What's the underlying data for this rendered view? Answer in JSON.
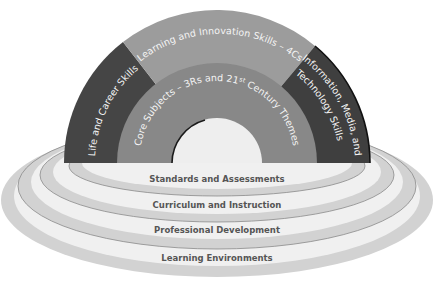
{
  "diagram": {
    "type": "rainbow-arch-framework",
    "arch": {
      "outer_band": [
        {
          "id": "life-career",
          "label": "Life and Career Skills",
          "color": "#454545"
        },
        {
          "id": "learning-innovation",
          "label": "Learning and Innovation Skills – 4Cs",
          "color": "#9c9c9c"
        },
        {
          "id": "info-media-tech",
          "label": "Information, Media, and Technology Skills",
          "label_line1": "Information, Media, and",
          "label_line2": "Technology Skills",
          "color": "#3f3f3f"
        }
      ],
      "inner_band": {
        "id": "core-subjects",
        "label": "Core Subjects – 3Rs and 21st Century Themes",
        "label_pre": "Core Subjects – 3Rs and 21",
        "label_sup": "st",
        "label_post": " Century Themes",
        "color": "#888888"
      },
      "center_color": "#eeeeee"
    },
    "support_systems": [
      {
        "label": "Standards and Assessments"
      },
      {
        "label": "Curriculum and Instruction"
      },
      {
        "label": "Professional Development"
      },
      {
        "label": "Learning Environments"
      }
    ],
    "colors": {
      "ring_fill": "#f0f0f0",
      "ring_rim": "#d2d2d2",
      "ring_line": "#8a8a8a",
      "label_text": "#555555"
    }
  }
}
